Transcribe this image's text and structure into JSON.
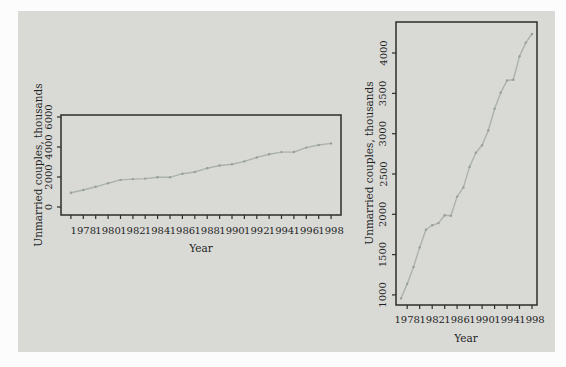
{
  "figure": {
    "background_color": "#fcfcfc",
    "panel_color": "#d9dad6"
  },
  "colors": {
    "panel": "#d9dad6",
    "plot_border": "#2d2d2d",
    "tick": "#2d2d2d",
    "text": "#1f1f1f",
    "line": "#acb2ac",
    "marker": "#989e98"
  },
  "chart_data": [
    {
      "type": "line",
      "title": "",
      "xlabel": "Year",
      "ylabel": "Unmarried couples, thousands",
      "x": [
        1977,
        1978,
        1979,
        1980,
        1981,
        1982,
        1983,
        1984,
        1985,
        1986,
        1987,
        1988,
        1989,
        1990,
        1991,
        1992,
        1993,
        1994,
        1995,
        1996,
        1997,
        1998
      ],
      "values": [
        957,
        1137,
        1346,
        1589,
        1808,
        1863,
        1891,
        1988,
        1983,
        2220,
        2334,
        2588,
        2764,
        2856,
        3039,
        3308,
        3510,
        3661,
        3668,
        3958,
        4130,
        4236
      ],
      "xlim": [
        1976.2,
        1998.8
      ],
      "ylim": [
        -530,
        6130
      ],
      "xticks": [
        1977,
        1978,
        1979,
        1980,
        1981,
        1982,
        1983,
        1984,
        1985,
        1986,
        1987,
        1988,
        1989,
        1990,
        1991,
        1992,
        1993,
        1994,
        1995,
        1996,
        1997,
        1998
      ],
      "xtick_labels": [
        1978,
        1980,
        1982,
        1984,
        1986,
        1988,
        1990,
        1992,
        1994,
        1996,
        1998
      ],
      "yticks": [
        0,
        2000,
        4000,
        6000
      ],
      "grid": false,
      "legend": "none",
      "markers": true
    },
    {
      "type": "line",
      "title": "",
      "xlabel": "Year",
      "ylabel": "Unmarried couples, thousands",
      "x": [
        1977,
        1978,
        1979,
        1980,
        1981,
        1982,
        1983,
        1984,
        1985,
        1986,
        1987,
        1988,
        1989,
        1990,
        1991,
        1992,
        1993,
        1994,
        1995,
        1996,
        1997,
        1998
      ],
      "values": [
        957,
        1137,
        1346,
        1589,
        1808,
        1863,
        1891,
        1988,
        1983,
        2220,
        2334,
        2588,
        2764,
        2856,
        3039,
        3308,
        3510,
        3661,
        3668,
        3958,
        4130,
        4236
      ],
      "xlim": [
        1976.2,
        1998.8
      ],
      "ylim": [
        875,
        4385
      ],
      "xticks": [
        1978,
        1980,
        1982,
        1984,
        1986,
        1988,
        1990,
        1992,
        1994,
        1996,
        1998
      ],
      "xtick_labels": [
        1978,
        1982,
        1986,
        1990,
        1994,
        1998
      ],
      "yticks": [
        1000,
        1500,
        2000,
        2500,
        3000,
        3500,
        4000
      ],
      "grid": false,
      "legend": "none",
      "markers": true
    }
  ]
}
